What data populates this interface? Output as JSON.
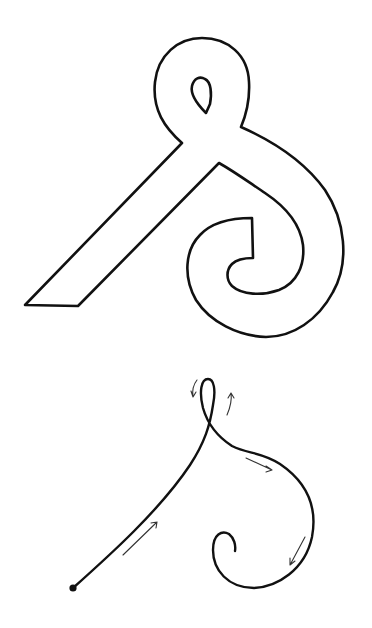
{
  "figure": {
    "background": "#ffffff",
    "ink_color": "#111111",
    "panels": [
      {
        "name": "letterform-outline",
        "description": "Outlined glyph shape: diagonal stroke, top loop with small counter, spiral tail hooking inward"
      },
      {
        "name": "stroke-path",
        "description": "Single-line pen path with start dot and direction arrows tracing the same glyph"
      }
    ],
    "annotations": {
      "start_dot": "start-point",
      "arrows": [
        "up-along-diagonal",
        "counterclockwise-left-of-loop",
        "up-right-of-loop",
        "down-right-along-curve",
        "down-left-bottom-of-curve"
      ]
    }
  }
}
